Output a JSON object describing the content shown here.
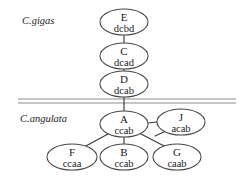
{
  "figure": {
    "background_color": "#ffffff",
    "width": 246,
    "height": 180
  },
  "chart_data": {
    "type": "diagram",
    "diagram_kind": "haplotype-network",
    "title": "",
    "node_stroke_color": "#444444",
    "edge_color": "#3a3a3a",
    "divider_color": "#8d8d8d",
    "groups": [
      {
        "id": "gigas",
        "label": "C.gigas",
        "label_x": 22,
        "label_y": 24,
        "members": [
          "E",
          "C",
          "D"
        ]
      },
      {
        "id": "angulata",
        "label": "C.angulata",
        "label_x": 20,
        "label_y": 122,
        "members": [
          "A",
          "J",
          "F",
          "B",
          "G"
        ]
      }
    ],
    "divider": {
      "y_top": 99,
      "y_bottom": 103,
      "x_start": 18,
      "x_end": 236
    },
    "nodes": [
      {
        "id": "E",
        "label": "E",
        "code": "dcbd",
        "cx": 124,
        "cy": 22,
        "rx": 24,
        "ry": 13,
        "group": "gigas"
      },
      {
        "id": "C",
        "label": "C",
        "code": "dcad",
        "cx": 124,
        "cy": 56,
        "rx": 24,
        "ry": 13,
        "group": "gigas"
      },
      {
        "id": "D",
        "label": "D",
        "code": "dcab",
        "cx": 124,
        "cy": 84,
        "rx": 24,
        "ry": 13,
        "group": "gigas"
      },
      {
        "id": "A",
        "label": "A",
        "code": "ccab",
        "cx": 124,
        "cy": 124,
        "rx": 24,
        "ry": 13,
        "group": "angulata"
      },
      {
        "id": "J",
        "label": "J",
        "code": "acab",
        "cx": 181,
        "cy": 122,
        "rx": 24,
        "ry": 13,
        "group": "angulata"
      },
      {
        "id": "F",
        "label": "F",
        "code": "ccaa",
        "cx": 72,
        "cy": 157,
        "rx": 25,
        "ry": 13,
        "group": "angulata"
      },
      {
        "id": "B",
        "label": "B",
        "code": "ccab",
        "cx": 124,
        "cy": 157,
        "rx": 24,
        "ry": 13,
        "group": "angulata"
      },
      {
        "id": "G",
        "label": "G",
        "code": "caab",
        "cx": 177,
        "cy": 157,
        "rx": 24,
        "ry": 13,
        "group": "angulata"
      }
    ],
    "edges": [
      {
        "from": "E",
        "to": "C",
        "x1": 124,
        "y1": 35,
        "x2": 124,
        "y2": 43
      },
      {
        "from": "C",
        "to": "D",
        "x1": 124,
        "y1": 69,
        "x2": 124,
        "y2": 71
      },
      {
        "from": "D",
        "to": "A",
        "x1": 124,
        "y1": 97,
        "x2": 124,
        "y2": 111
      },
      {
        "from": "A",
        "to": "J",
        "x1": 148,
        "y1": 123,
        "x2": 157,
        "y2": 122
      },
      {
        "from": "A",
        "to": "F",
        "x1": 108,
        "y1": 134,
        "x2": 84,
        "y2": 147
      },
      {
        "from": "A",
        "to": "B",
        "x1": 124,
        "y1": 137,
        "x2": 124,
        "y2": 144
      },
      {
        "from": "A",
        "to": "G",
        "x1": 141,
        "y1": 134,
        "x2": 166,
        "y2": 147
      },
      {
        "from": "J",
        "to": "G",
        "x1": 166,
        "y1": 131,
        "x2": 155,
        "y2": 136
      }
    ]
  }
}
